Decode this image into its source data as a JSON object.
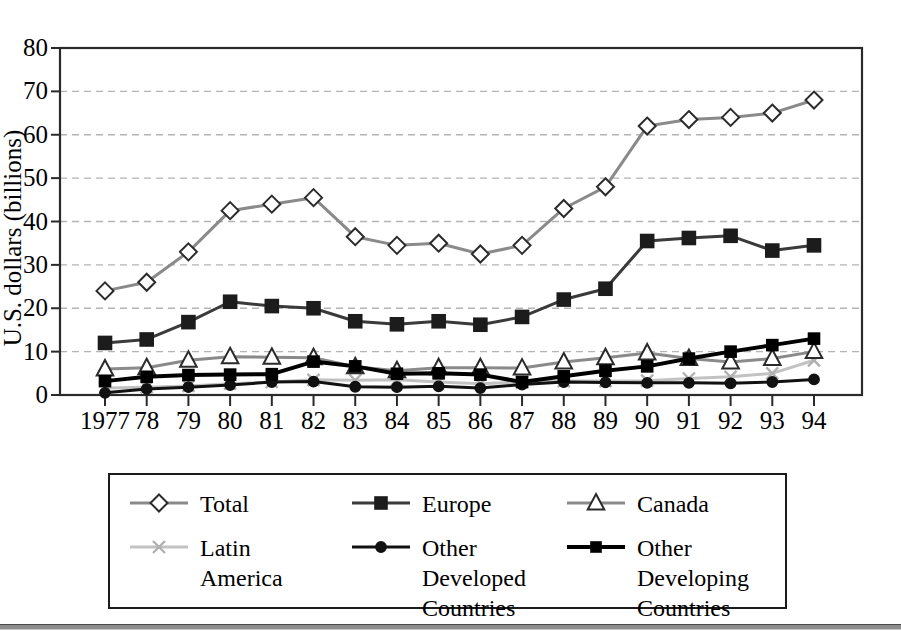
{
  "figure": {
    "background": "#ffffff",
    "frame_color": "#2a2a2a",
    "gridline_color": "#b4b4b4"
  },
  "axis": {
    "ylabel": "U.S. dollars (billions)",
    "y_ticks": [
      "80",
      "70",
      "60",
      "50",
      "40",
      "30",
      "20",
      "10",
      "0"
    ],
    "x_ticks": [
      "1977",
      "78",
      "79",
      "80",
      "81",
      "82",
      "83",
      "84",
      "85",
      "86",
      "87",
      "88",
      "89",
      "90",
      "91",
      "92",
      "93",
      "94"
    ]
  },
  "legend": {
    "entries": [
      {
        "label": "Total",
        "icon": "diamond-marker-icon",
        "color": "#8a8a8a",
        "marker": "diamond",
        "marker_fill": "#ffffff",
        "marker_stroke": "#2b2b2b",
        "line_width": 3
      },
      {
        "label": "Europe",
        "icon": "square-marker-icon",
        "color": "#3a3a3a",
        "marker": "square",
        "marker_fill": "#1c1c1c",
        "marker_stroke": "#1c1c1c",
        "line_width": 3
      },
      {
        "label": "Canada",
        "icon": "triangle-marker-icon",
        "color": "#8a8a8a",
        "marker": "triangle",
        "marker_fill": "#ffffff",
        "marker_stroke": "#2b2b2b",
        "line_width": 3
      },
      {
        "label": "Latin\nAmerica",
        "icon": "cross-marker-icon",
        "color": "#c2c2c2",
        "marker": "cross",
        "marker_fill": "#c2c2c2",
        "marker_stroke": "#b0b0b0",
        "line_width": 3
      },
      {
        "label": "Other\nDeveloped\nCountries",
        "icon": "circle-marker-icon",
        "color": "#111111",
        "marker": "circle",
        "marker_fill": "#111111",
        "marker_stroke": "#111111",
        "line_width": 3
      },
      {
        "label": "Other\nDeveloping\nCountries",
        "icon": "square-marker-icon",
        "color": "#000000",
        "marker": "square",
        "marker_fill": "#000000",
        "marker_stroke": "#000000",
        "line_width": 4
      }
    ]
  },
  "chart_data": {
    "type": "line",
    "title": "",
    "xlabel": "",
    "ylabel": "U.S. dollars (billions)",
    "ylim": [
      0,
      80
    ],
    "ytick_step": 10,
    "grid": true,
    "legend_position": "bottom",
    "categories": [
      "1977",
      "78",
      "79",
      "80",
      "81",
      "82",
      "83",
      "84",
      "85",
      "86",
      "87",
      "88",
      "89",
      "90",
      "91",
      "92",
      "93",
      "94"
    ],
    "series": [
      {
        "name": "Total",
        "values": [
          24.0,
          26.0,
          33.0,
          42.5,
          44.0,
          45.5,
          36.5,
          34.5,
          35.0,
          32.5,
          34.5,
          43.0,
          48.0,
          62.0,
          63.5,
          64.0,
          65.0,
          68.0
        ]
      },
      {
        "name": "Europe",
        "values": [
          12.0,
          12.8,
          16.8,
          21.5,
          20.5,
          20.0,
          17.0,
          16.3,
          17.0,
          16.2,
          18.0,
          22.0,
          24.5,
          35.5,
          36.2,
          36.7,
          33.3,
          34.5
        ]
      },
      {
        "name": "Canada",
        "values": [
          6.0,
          6.3,
          8.0,
          8.8,
          8.7,
          8.6,
          6.5,
          5.6,
          6.3,
          6.3,
          6.2,
          7.6,
          8.6,
          9.7,
          8.4,
          7.6,
          8.4,
          10.0
        ]
      },
      {
        "name": "Latin America",
        "values": [
          1.6,
          1.8,
          2.1,
          2.6,
          3.0,
          3.5,
          3.4,
          3.5,
          3.0,
          2.6,
          3.0,
          3.2,
          3.2,
          3.3,
          3.8,
          4.2,
          5.0,
          8.0
        ]
      },
      {
        "name": "Other Developed Countries",
        "values": [
          0.5,
          1.4,
          1.8,
          2.3,
          3.0,
          3.1,
          1.9,
          1.8,
          2.0,
          1.6,
          2.4,
          3.0,
          2.9,
          2.8,
          2.8,
          2.7,
          3.0,
          3.6
        ]
      },
      {
        "name": "Other Developing Countries",
        "values": [
          3.2,
          4.2,
          4.6,
          4.7,
          4.8,
          7.7,
          6.6,
          4.9,
          5.0,
          4.7,
          3.0,
          4.3,
          5.6,
          6.6,
          8.4,
          10.0,
          11.5,
          13.0
        ]
      }
    ]
  }
}
